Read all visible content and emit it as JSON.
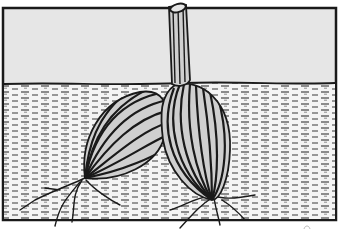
{
  "image": {
    "subject": "Cross-section illustration of two bulbs planted in soil with a single stem rising above ground",
    "style": "black-and-white line drawing",
    "colors": {
      "ink": "#1a1a1a",
      "air": "#e6e6e6",
      "soil": "#f2f2f2",
      "bulb_fill": "#cfcfcf"
    },
    "elements": [
      "frame",
      "air-region",
      "soil-surface",
      "soil-texture",
      "left-bulb",
      "right-bulb",
      "stem",
      "roots"
    ]
  }
}
